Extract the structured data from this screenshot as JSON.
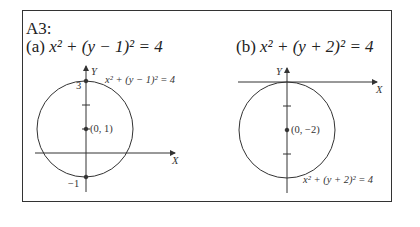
{
  "title": "A3:",
  "parts": [
    {
      "label": "(a)",
      "equation": "x² + (y − 1)² = 4",
      "center_label": "(0, 1)",
      "curve_label": "x² + (y − 1)² = 4",
      "y_top_label": "3",
      "y_bottom_label": "−1",
      "x_axis_label": "X",
      "y_axis_label": "Y"
    },
    {
      "label": "(b)",
      "equation": "x² + (y + 2)² = 4",
      "center_label": "(0, −2)",
      "curve_label": "x² + (y + 2)² = 4",
      "x_axis_label": "X",
      "y_axis_label": "Y"
    }
  ]
}
